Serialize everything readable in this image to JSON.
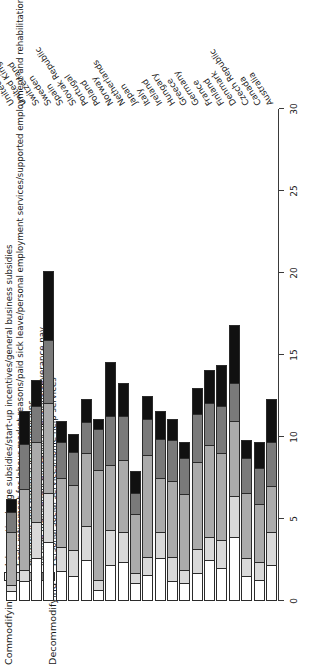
{
  "chart_data": {
    "type": "bar",
    "orientation": "horizontal-stacked",
    "title": "",
    "xlabel": "",
    "ylabel": "",
    "xlim": [
      0,
      30
    ],
    "grid": false,
    "legend_position": "top-left",
    "legend_groups": [
      {
        "label": "Commodifying",
        "series": [
          "Job creation/wage subsidies/start-up incentives/general business subsidies",
          "Early retirement for labour market reasons/paid sick leave/personal employment services/supported employment and rehabilitation/training"
        ]
      },
      {
        "label": "Decommodifying",
        "series": [
          "Maternity and parental leave/pensions",
          "Income maintenance/disability pensions/severance pay",
          "Personal social services/home-help services"
        ]
      }
    ],
    "ticks": [
      0,
      5,
      10,
      15,
      20,
      25,
      30
    ],
    "categories": [
      "Australia",
      "Canada",
      "Czech Republic",
      "Denmark",
      "Finland",
      "France",
      "Germany",
      "Greece",
      "Hungary",
      "Ireland",
      "Italy",
      "Japan",
      "Netherlands",
      "Norway",
      "Poland",
      "Portugal",
      "Slovak Republic",
      "Spain",
      "Sweden",
      "Switzerland",
      "United Kingdom",
      "United States"
    ],
    "series": [
      {
        "name": "Job creation/wage subsidies/start-up incentives/general business subsidies",
        "color": "#ffffff",
        "values": [
          2.2,
          1.3,
          1.5,
          3.9,
          2.0,
          2.5,
          1.7,
          1.1,
          1.2,
          2.6,
          1.6,
          1.1,
          2.4,
          2.2,
          0.7,
          2.5,
          1.5,
          1.8,
          3.6,
          2.6,
          1.2,
          0.6
        ]
      },
      {
        "name": "Early retirement for labour market reasons/paid sick leave/personal employment services/supported employment and rehabilitation/training",
        "color": "#d9d9d9",
        "values": [
          2.0,
          1.1,
          1.1,
          2.5,
          1.7,
          1.4,
          1.5,
          0.8,
          1.5,
          1.6,
          1.1,
          0.6,
          1.8,
          2.1,
          0.6,
          2.1,
          1.6,
          1.5,
          3.0,
          2.2,
          0.7,
          0.4
        ]
      },
      {
        "name": "Maternity and parental leave/pensions",
        "color": "#ababab",
        "values": [
          2.8,
          3.5,
          4.0,
          4.6,
          5.3,
          5.6,
          5.3,
          4.6,
          4.6,
          3.3,
          6.2,
          3.6,
          4.4,
          4.0,
          6.7,
          4.4,
          4.0,
          4.2,
          5.5,
          4.9,
          4.9,
          3.2
        ]
      },
      {
        "name": "Income maintenance/disability pensions/severance pay",
        "color": "#7a7a7a",
        "values": [
          2.7,
          2.2,
          2.1,
          2.3,
          2.9,
          2.6,
          2.9,
          2.2,
          2.5,
          2.4,
          2.2,
          1.3,
          2.7,
          3.0,
          2.5,
          1.9,
          2.0,
          2.2,
          3.8,
          2.2,
          2.8,
          1.2
        ]
      },
      {
        "name": "Personal social services/home-help services",
        "color": "#111111",
        "values": [
          2.6,
          1.6,
          1.1,
          3.5,
          2.5,
          2.0,
          1.6,
          1.0,
          1.3,
          1.7,
          1.4,
          1.3,
          2.0,
          3.3,
          0.6,
          1.4,
          1.1,
          1.3,
          4.2,
          1.6,
          2.0,
          0.8
        ]
      }
    ]
  }
}
